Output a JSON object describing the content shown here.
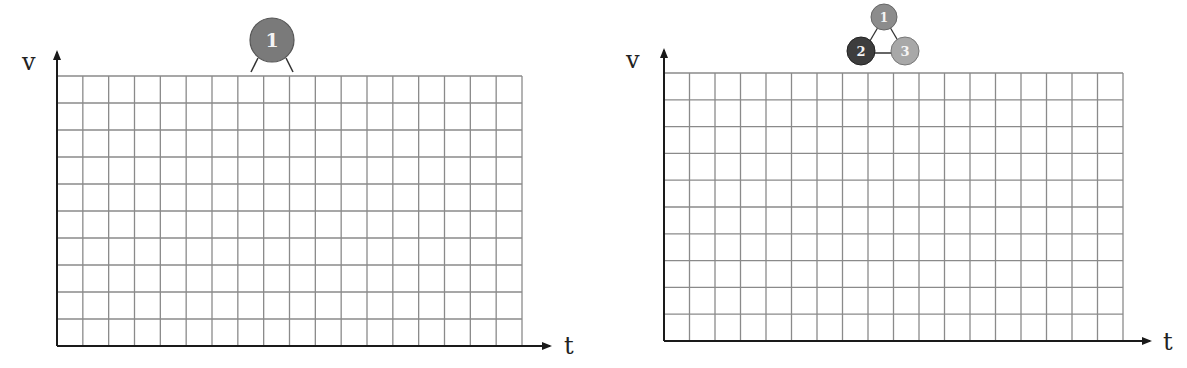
{
  "panels": [
    {
      "name": "left-panel",
      "y_axis_label": "v",
      "x_axis_label": "t",
      "grid_columns": 18,
      "grid_rows": 10,
      "molecule": {
        "type": "single",
        "atoms": [
          {
            "label": "1",
            "color": "#7a7a7a"
          }
        ]
      }
    },
    {
      "name": "right-panel",
      "y_axis_label": "v",
      "x_axis_label": "t",
      "grid_columns": 18,
      "grid_rows": 10,
      "molecule": {
        "type": "triangle",
        "atoms": [
          {
            "label": "1",
            "color": "#8c8c8c"
          },
          {
            "label": "2",
            "color": "#3d3d3d"
          },
          {
            "label": "3",
            "color": "#a8a8a8"
          }
        ]
      }
    }
  ]
}
